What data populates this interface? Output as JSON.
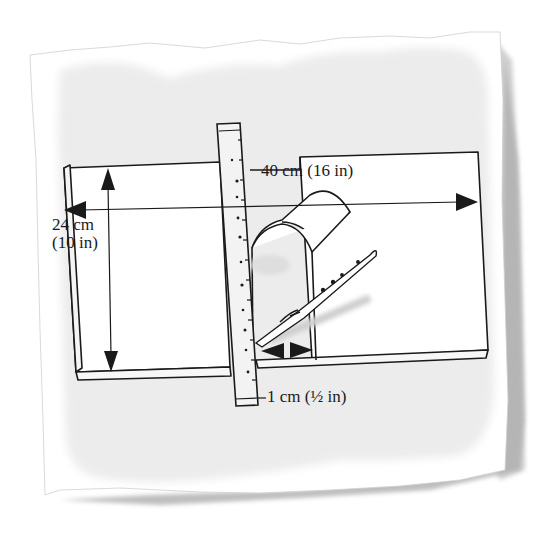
{
  "diagram": {
    "labels": {
      "width": "40 cm (16 in)",
      "height_line1": "24 cm",
      "height_line2": "(10 in)",
      "gap": "1 cm (½ in)"
    },
    "elements": [
      "torn-paper-background",
      "board",
      "ruler",
      "curved-arch-piece",
      "craft-knife",
      "width-arrow",
      "height-arrow",
      "gap-arrow"
    ],
    "colors": {
      "paper": "#ffffff",
      "wash": "#ececec",
      "shadow": "#9a9a9a",
      "ink": "#1a1a1a",
      "ruler": "#f3f3f3"
    }
  }
}
